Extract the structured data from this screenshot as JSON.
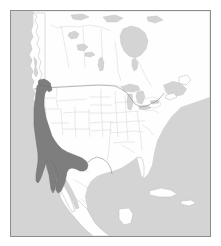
{
  "figure": {
    "kind": "species-range-map",
    "region_title": "North America",
    "caption": "",
    "width_px": 221,
    "height_px": 246
  },
  "colors": {
    "ocean": "#d4d4d4",
    "land": "#fefefe",
    "land_outline": "#b9b9b9",
    "subdivision_border": "#cfcfcf",
    "national_border": "#8e8e8e",
    "range_fill": "#7e7e7e",
    "range_outline": "#6d6d6d",
    "frame": "#8d8d8d",
    "page_background": "#ffffff"
  },
  "frame": {
    "left_px": 10,
    "top_px": 10,
    "width_px": 201,
    "height_px": 227,
    "border_width_px": 1
  },
  "legend": {
    "visible": false,
    "entries": [
      {
        "label": "Distribution range",
        "swatch": "#7e7e7e"
      }
    ]
  },
  "layers": [
    {
      "name": "ocean",
      "label": "Ocean / water bodies",
      "visible": true
    },
    {
      "name": "landmass",
      "label": "Land",
      "visible": true
    },
    {
      "name": "subdivisions",
      "label": "States and provinces",
      "visible": true
    },
    {
      "name": "national-borders",
      "label": "International boundaries",
      "visible": true
    },
    {
      "name": "range-overlay",
      "label": "Shaded distribution range",
      "visible": true
    }
  ],
  "range_description": {
    "label": "Western North America coastal range",
    "extent_note": "Pacific coast from southern British Columbia / Washington south through Oregon, California and Baja California, extending inland across Nevada, Arizona and into northwestern Mexico"
  },
  "scalebar": {
    "visible": false,
    "text": ""
  },
  "north_arrow": {
    "visible": false,
    "text": ""
  }
}
